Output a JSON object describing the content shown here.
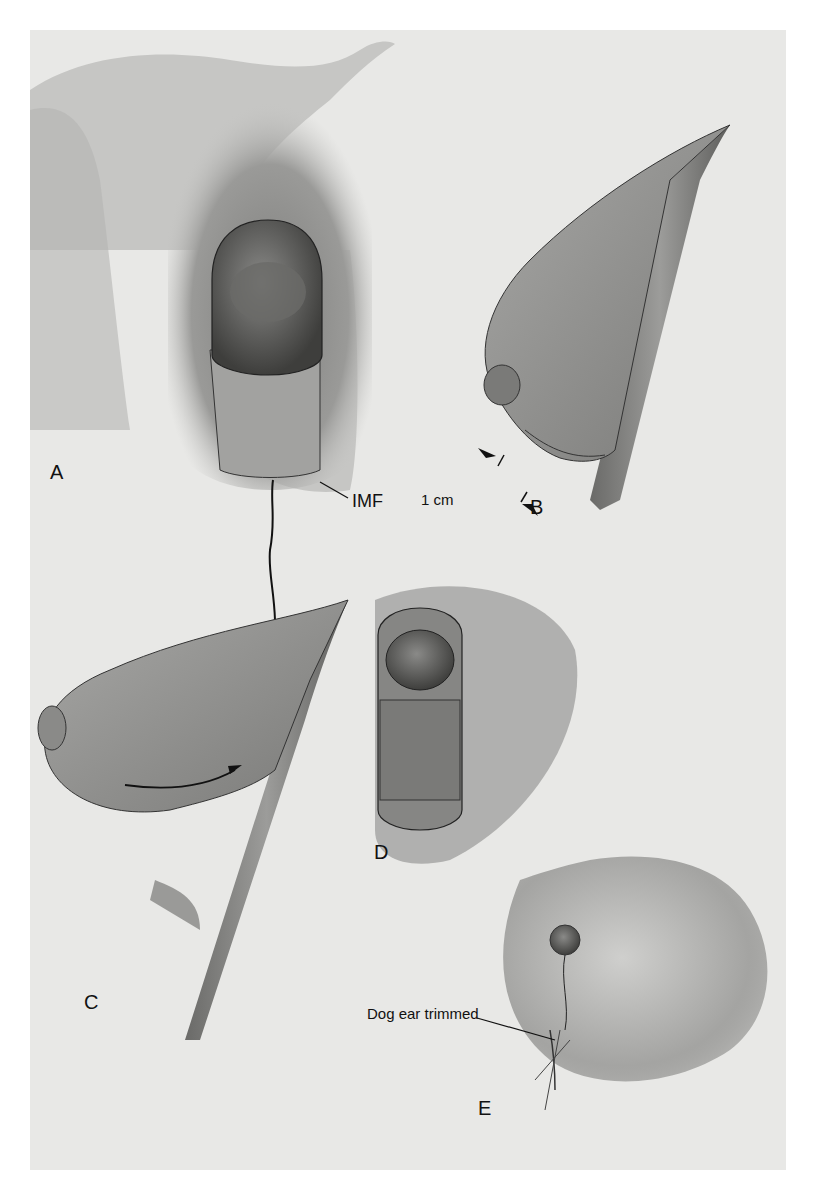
{
  "figure": {
    "panels": [
      {
        "id": "A",
        "label": "A"
      },
      {
        "id": "B",
        "label": "B"
      },
      {
        "id": "C",
        "label": "C"
      },
      {
        "id": "D",
        "label": "D"
      },
      {
        "id": "E",
        "label": "E"
      }
    ],
    "annotations": {
      "imf": "IMF",
      "measurement": "1 cm",
      "dog_ear": "Dog ear trimmed"
    },
    "colors": {
      "background": "#e8e8e6",
      "skin_light": "#bdbdbb",
      "skin_mid": "#9a9a98",
      "skin_dark": "#6e6e6c",
      "tissue": "#8c8c8a",
      "line": "#1a1a1a"
    }
  }
}
